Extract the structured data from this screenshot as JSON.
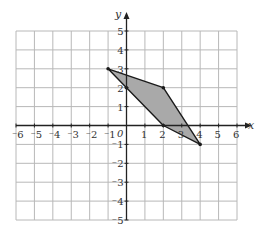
{
  "chart_data": {
    "type": "scatter",
    "title": "",
    "xlabel": "x",
    "ylabel": "y",
    "xlim": [
      -6,
      6
    ],
    "ylim": [
      -5,
      5
    ],
    "grid": true,
    "origin_label": "0",
    "x_ticks": [
      "⁻6",
      "⁻5",
      "⁻4",
      "⁻3",
      "⁻2",
      "⁻1",
      "1",
      "2",
      "3",
      "4",
      "5",
      "6"
    ],
    "x_tick_values": [
      -6,
      -5,
      -4,
      -3,
      -2,
      -1,
      1,
      2,
      3,
      4,
      5,
      6
    ],
    "y_ticks": [
      "5",
      "4",
      "3",
      "2",
      "1",
      "⁻1",
      "⁻2",
      "⁻3",
      "⁻4",
      "⁻5"
    ],
    "y_tick_values": [
      5,
      4,
      3,
      2,
      1,
      -1,
      -2,
      -3,
      -4,
      -5
    ],
    "series": [
      {
        "name": "shaded polygon",
        "shape": "polygon",
        "vertices": [
          [
            -1,
            3
          ],
          [
            2,
            2
          ],
          [
            4,
            -1
          ],
          [
            2,
            0
          ],
          [
            0,
            2
          ]
        ],
        "fill": "#a9a9a9",
        "stroke": "#1a1a1a"
      }
    ]
  },
  "colors": {
    "grid": "#b8b8b8",
    "axis": "#222222",
    "fill": "#a9a9a9",
    "outline": "#1a1a1a"
  }
}
